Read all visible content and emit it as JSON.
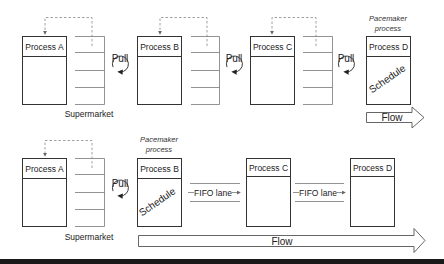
{
  "top_row": {
    "processes": [
      {
        "label": "Process A"
      },
      {
        "label": "Process B"
      },
      {
        "label": "Process C"
      },
      {
        "label": "Process D",
        "pacemaker_caption_line1": "Pacemaker",
        "pacemaker_caption_line2": "process",
        "inner_text": "Schedule"
      }
    ],
    "pull_labels": [
      "Pull",
      "Pull",
      "Pull"
    ],
    "supermarket_label": "Supermarket",
    "flow_label": "Flow"
  },
  "bottom_row": {
    "processes": [
      {
        "label": "Process A"
      },
      {
        "label": "Process B",
        "pacemaker_caption_line1": "Pacemaker",
        "pacemaker_caption_line2": "process",
        "inner_text": "Schedule"
      },
      {
        "label": "Process C"
      },
      {
        "label": "Process D"
      }
    ],
    "pull_label": "Pull",
    "supermarket_label": "Supermarket",
    "fifo_labels": [
      "FIFO lane",
      "FIFO lane"
    ],
    "flow_label": "Flow"
  },
  "colors": {
    "stroke": "#333333",
    "dashed": "#888888",
    "band": "#1a1a1a"
  }
}
